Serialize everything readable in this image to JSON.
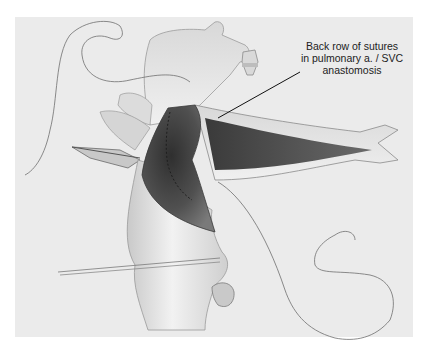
{
  "figure": {
    "annotation": {
      "lines": [
        "Back row of sutures",
        "in pulmonary a. / SVC",
        "anastomosis"
      ]
    },
    "colors": {
      "background": "#ffffff",
      "panel": "#ebebeb",
      "tissue_light": "#e2e2e2",
      "tissue_mid": "#b8b8b8",
      "lumen_dark": "#4a4a4a",
      "suture_line": "#6e6e6e"
    }
  }
}
